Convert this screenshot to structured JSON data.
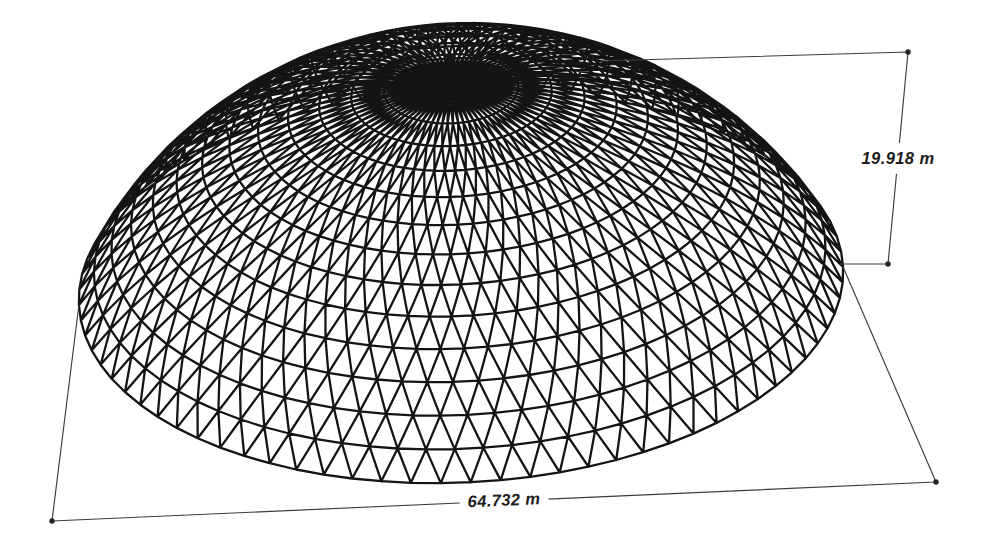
{
  "figure": {
    "background": "#ffffff"
  },
  "dimensions": {
    "height_label": "19.918 m",
    "span_label": "64.732 m"
  },
  "dome": {
    "span_m": 64.732,
    "height_m": 19.918,
    "rings": 14,
    "segments": 80,
    "mesh_color": "#141414",
    "dim_line_color": "#3c3c3c",
    "dot_color": "#222222",
    "view": {
      "elevation_deg": 30.9,
      "roll_deg": -2.85,
      "px_per_m": 11.82,
      "center_x": 461,
      "center_y": 286
    }
  }
}
